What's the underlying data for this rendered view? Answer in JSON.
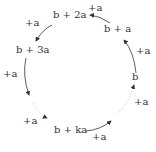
{
  "diagram": {
    "nodes": [
      {
        "id": "b",
        "label": "b"
      },
      {
        "id": "b_plus_a",
        "label": "b + a"
      },
      {
        "id": "b_plus_2a",
        "label": "b + 2a"
      },
      {
        "id": "b_plus_3a",
        "label": "b + 3a"
      },
      {
        "id": "b_plus_ka",
        "label": "b + ka"
      }
    ],
    "edges": [
      {
        "from": "b",
        "to": "b_plus_a",
        "label": "+a",
        "style": "solid"
      },
      {
        "from": "b_plus_a",
        "to": "b_plus_2a",
        "label": "+a",
        "style": "solid"
      },
      {
        "from": "b_plus_2a",
        "to": "b_plus_3a",
        "label": "+a",
        "style": "solid"
      },
      {
        "from": "b_plus_3a",
        "to": "b_plus_ka",
        "label": "+a",
        "style": "solid-then-dotted"
      },
      {
        "from": "b_plus_3a",
        "to": "b_plus_ka",
        "label": "+a",
        "style": "dotted"
      },
      {
        "from": "b_plus_ka",
        "to": "b",
        "label": "+a",
        "style": "solid-then-dotted"
      },
      {
        "from": "b_plus_ka",
        "to": "b",
        "label": "+a",
        "style": "dotted"
      }
    ],
    "op_label": "+a"
  }
}
